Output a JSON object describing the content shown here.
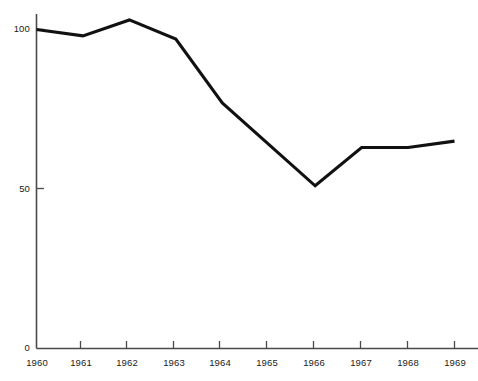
{
  "chart_data": {
    "type": "line",
    "title": "",
    "subtitle": "",
    "xlabel": "",
    "ylabel": "",
    "categories": [
      "1960",
      "1961",
      "1962",
      "1963",
      "1964",
      "1965",
      "1966",
      "1967",
      "1968",
      "1969"
    ],
    "x": [
      1960,
      1961,
      1962,
      1963,
      1964,
      1965,
      1966,
      1967,
      1968,
      1969
    ],
    "values": [
      100,
      98,
      103,
      97,
      77,
      64,
      51,
      63,
      63,
      65
    ],
    "series": [
      {
        "name": "index",
        "values": [
          100,
          98,
          103,
          97,
          77,
          64,
          51,
          63,
          63,
          65
        ],
        "color": "#111111"
      }
    ],
    "ylim": [
      0,
      110
    ],
    "xlim": [
      1960,
      1969
    ],
    "yticks": [
      0,
      50,
      100
    ],
    "ytick_labels": [
      "0",
      "50",
      "100"
    ],
    "xtick_labels": [
      "1960",
      "1961",
      "1962",
      "1963",
      "1964",
      "1965",
      "1966",
      "1967",
      "1968",
      "1969"
    ],
    "grid": false,
    "legend": false,
    "legend_position": "none",
    "annotations": [],
    "line_color": "#111111",
    "axis_color": "#4a4a4a",
    "background_color": "#ffffff"
  },
  "axes": {
    "y_ticks": [
      {
        "label": "100",
        "value": 100
      },
      {
        "label": "50",
        "value": 50
      },
      {
        "label": "0",
        "value": 0
      }
    ],
    "x_ticks": [
      {
        "label": "1960",
        "value": 1960
      },
      {
        "label": "1961",
        "value": 1961
      },
      {
        "label": "1962",
        "value": 1962
      },
      {
        "label": "1963",
        "value": 1963
      },
      {
        "label": "1964",
        "value": 1964
      },
      {
        "label": "1965",
        "value": 1965
      },
      {
        "label": "1966",
        "value": 1966
      },
      {
        "label": "1967",
        "value": 1967
      },
      {
        "label": "1968",
        "value": 1968
      },
      {
        "label": "1969",
        "value": 1969
      }
    ]
  }
}
